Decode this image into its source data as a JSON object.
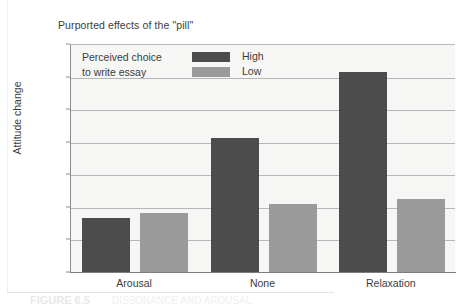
{
  "chart_data": {
    "type": "bar",
    "title": "Purported effects of the \"pill\"",
    "xlabel": "",
    "ylabel": "Attitude change",
    "categories": [
      "Arousal",
      "None",
      "Relaxation"
    ],
    "series": [
      {
        "name": "High",
        "color": "#4c4c4c",
        "values": [
          3.3,
          8.25,
          12.3
        ]
      },
      {
        "name": "Low",
        "color": "#9b9b9b",
        "values": [
          3.6,
          4.2,
          4.5
        ]
      }
    ],
    "ylim": [
      0,
      14
    ],
    "yticks": [
      0,
      2,
      4,
      6,
      8,
      10,
      12,
      14
    ],
    "ytick_labels": [
      "0",
      "2",
      "4",
      "6",
      "8",
      "10",
      "12",
      "14"
    ],
    "grid": true,
    "legend_position": "top-left-inside",
    "legend": {
      "title_line1": "Perceived choice",
      "title_line2": "to write essay",
      "entries": [
        "High",
        "Low"
      ]
    }
  },
  "caption": {
    "figure_number": "FIGURE 6.5",
    "text": "DISSONANCE AND AROUSAL"
  },
  "colors": {
    "high": "#4c4c4c",
    "low": "#9b9b9b",
    "plot_background": "#f6f6f4",
    "gridline": "#b6b6b6",
    "axis": "#8e8e8e",
    "text": "#3c3c3c"
  }
}
